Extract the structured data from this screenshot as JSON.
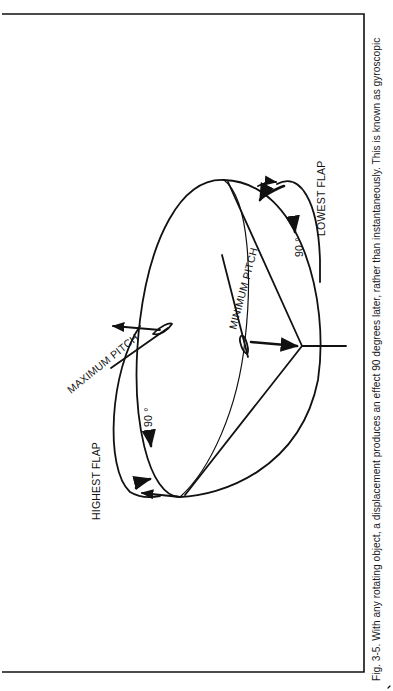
{
  "figure": {
    "caption": "Fig. 3-5. With any rotating object,  a displacement produces an effect 90 degrees later, rather than instantaneously.  This is known as gyroscopic",
    "labels": {
      "highest_flap": "HIGHEST FLAP",
      "lowest_flap": "LOWEST FLAP",
      "maximum_pitch": "MAXIMUM PITCH",
      "minimum_pitch": "MINIMUM PITCH",
      "angle_left": "90 °",
      "angle_right": "90 °"
    },
    "orientation": "rotated 90° counter-clockwise",
    "colors": {
      "ink": "#111111",
      "paper": "#ffffff"
    }
  }
}
